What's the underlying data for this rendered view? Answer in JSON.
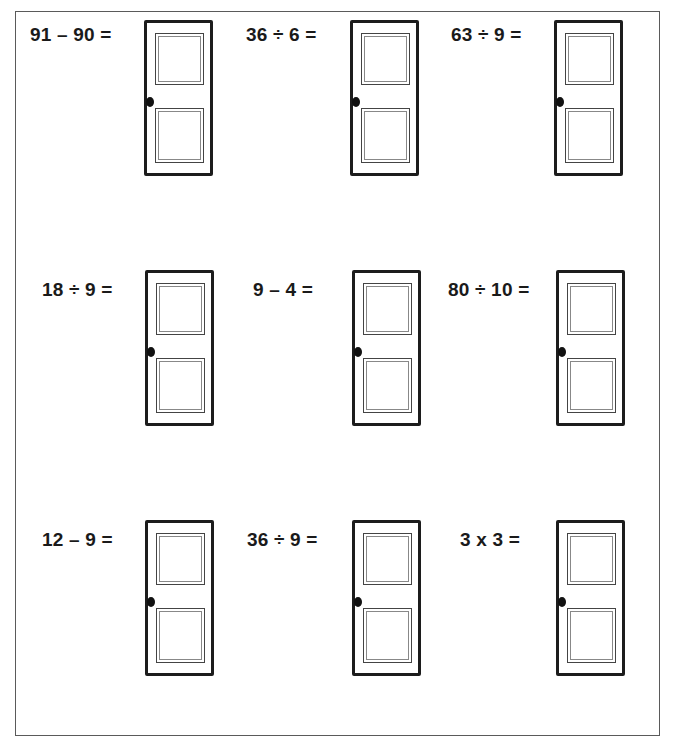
{
  "worksheet": {
    "title": "",
    "problems": [
      {
        "expression": "91 – 90 =",
        "answer_door": "door"
      },
      {
        "expression": "36 ÷ 6 =",
        "answer_door": "door"
      },
      {
        "expression": "63 ÷ 9 =",
        "answer_door": "door"
      },
      {
        "expression": "18 ÷ 9 =",
        "answer_door": "door"
      },
      {
        "expression": "9 – 4 =",
        "answer_door": "door"
      },
      {
        "expression": "80 ÷ 10 =",
        "answer_door": "door"
      },
      {
        "expression": "12 – 9 =",
        "answer_door": "door"
      },
      {
        "expression": "36 ÷ 9 =",
        "answer_door": "door"
      },
      {
        "expression": "3 x 3 =",
        "answer_door": "door"
      }
    ]
  }
}
